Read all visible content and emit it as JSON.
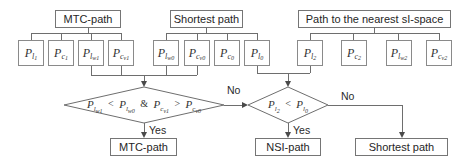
{
  "sources": [
    {
      "label": "MTC-path"
    },
    {
      "label": "Shortest path"
    },
    {
      "label": "Path to the nearest sI-space"
    }
  ],
  "params": {
    "mtc": [
      {
        "base": "P",
        "sub": "l",
        "subsub": "1"
      },
      {
        "base": "P",
        "sub": "c",
        "subsub": "1"
      },
      {
        "base": "P",
        "sub": "l",
        "subsub": "w1"
      },
      {
        "base": "P",
        "sub": "c",
        "subsub": "v1"
      }
    ],
    "shortest": [
      {
        "base": "P",
        "sub": "l",
        "subsub": "w0"
      },
      {
        "base": "P",
        "sub": "c",
        "subsub": "v0"
      },
      {
        "base": "P",
        "sub": "c",
        "subsub": "0"
      },
      {
        "base": "P",
        "sub": "l",
        "subsub": "0"
      }
    ],
    "nearest": [
      {
        "base": "P",
        "sub": "l",
        "subsub": "2"
      },
      {
        "base": "P",
        "sub": "c",
        "subsub": "2"
      },
      {
        "base": "P",
        "sub": "l",
        "subsub": "w2"
      },
      {
        "base": "P",
        "sub": "c",
        "subsub": "v2"
      }
    ]
  },
  "decision1": {
    "t1": {
      "base": "P",
      "sub": "l",
      "subsub": "w1"
    },
    "op1": "<",
    "t2": {
      "base": "P",
      "sub": "l",
      "subsub": "w0"
    },
    "amp": "&",
    "t3": {
      "base": "P",
      "sub": "c",
      "subsub": "v1"
    },
    "op2": ">",
    "t4": {
      "base": "P",
      "sub": "c",
      "subsub": "v0"
    }
  },
  "decision2": {
    "t1": {
      "base": "P",
      "sub": "l",
      "subsub": "2"
    },
    "op1": "<",
    "t2": {
      "base": "P",
      "sub": "l",
      "subsub": "0"
    }
  },
  "labels": {
    "yes1": "Yes",
    "no1": "No",
    "yes2": "Yes",
    "no2": "No"
  },
  "outputs": [
    {
      "label": "MTC-path"
    },
    {
      "label": "NSI-path"
    },
    {
      "label": "Shortest path"
    }
  ],
  "colors": {
    "line": "#6e6e6e",
    "border": "#757575",
    "text": "#262626",
    "background": "#ffffff"
  }
}
